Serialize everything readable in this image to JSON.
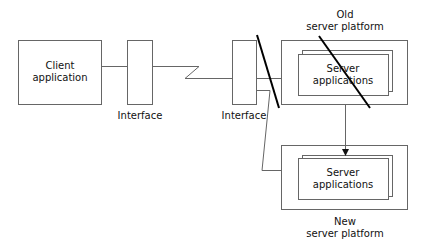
{
  "diagram": {
    "client": {
      "line1": "Client",
      "line2": "application"
    },
    "interface_left": {
      "label": "Interface"
    },
    "interface_right": {
      "label": "Interface"
    },
    "old_server": {
      "title_line1": "Old",
      "title_line2": "server platform",
      "apps_line1": "Server",
      "apps_line2": "applications",
      "crossed_out": true
    },
    "new_server": {
      "title_line1": "New",
      "title_line2": "server platform",
      "apps_line1": "Server",
      "apps_line2": "applications"
    },
    "colors": {
      "stroke": "#555555",
      "strike": "#000000",
      "text": "#111111"
    }
  }
}
